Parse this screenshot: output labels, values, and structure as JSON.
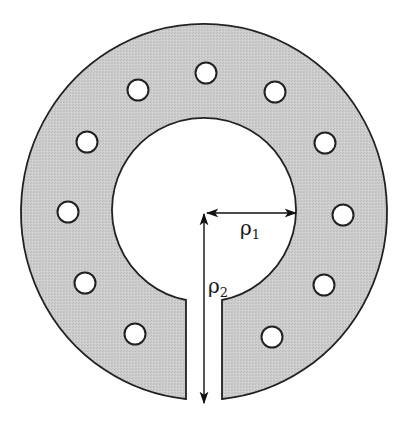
{
  "figure": {
    "colors": {
      "ring_fill": "#c9c9c9",
      "stroke": "#222222",
      "background": "#ffffff",
      "hole_fill": "#ffffff"
    },
    "hole_count": 12,
    "labels": {
      "rho1": {
        "symbol": "ρ",
        "subscript": "1"
      },
      "rho2": {
        "symbol": "ρ",
        "subscript": "2"
      }
    }
  }
}
